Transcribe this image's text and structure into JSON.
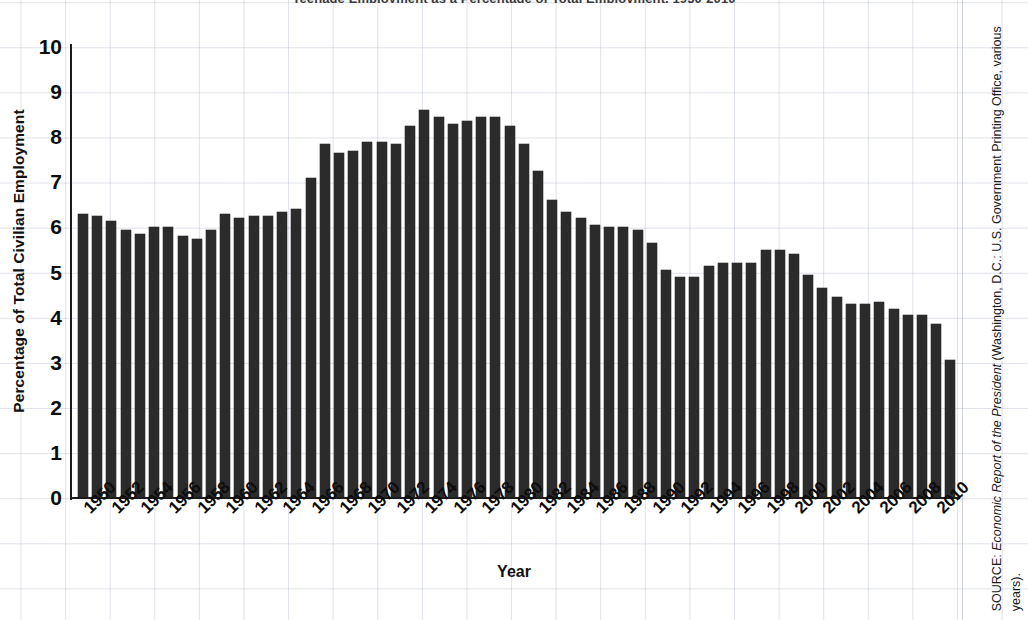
{
  "title": "Teenage Employment as a Percentage of Total Employment, 1950-2010",
  "axes": {
    "y_title": "Percentage of Total Civilian Employment",
    "x_title": "Year",
    "y_ticks": [
      "10",
      "9",
      "8",
      "7",
      "6",
      "5",
      "4",
      "3",
      "2",
      "1",
      "0"
    ]
  },
  "source": {
    "prefix": "SOURCE: ",
    "italic": "Economic Report of the President",
    "rest": " (Washington, D.C.: U.S. Government Printing Office, various years)."
  },
  "colors": {
    "bar": "#2b2b2b",
    "axis": "#1c1c1c",
    "grid": "#96a0b9",
    "background": "#ffffff"
  },
  "chart_data": {
    "type": "bar",
    "title": "Teenage Employment as a Percentage of Total Employment, 1950-2010",
    "xlabel": "Year",
    "ylabel": "Percentage of Total Civilian Employment",
    "ylim": [
      0,
      10
    ],
    "ytick_step": 1,
    "grid": true,
    "legend": "none",
    "xtick_step": 2,
    "categories": [
      1950,
      1951,
      1952,
      1953,
      1954,
      1955,
      1956,
      1957,
      1958,
      1959,
      1960,
      1961,
      1962,
      1963,
      1964,
      1965,
      1966,
      1967,
      1968,
      1969,
      1970,
      1971,
      1972,
      1973,
      1974,
      1975,
      1976,
      1977,
      1978,
      1979,
      1980,
      1981,
      1982,
      1983,
      1984,
      1985,
      1986,
      1987,
      1988,
      1989,
      1990,
      1991,
      1992,
      1993,
      1994,
      1995,
      1996,
      1997,
      1998,
      1999,
      2000,
      2001,
      2002,
      2003,
      2004,
      2005,
      2006,
      2007,
      2008,
      2009,
      2010
    ],
    "values": [
      6.3,
      6.25,
      6.15,
      5.95,
      5.85,
      6.0,
      6.0,
      5.8,
      5.75,
      5.95,
      6.3,
      6.2,
      6.25,
      6.25,
      6.35,
      6.4,
      7.1,
      7.85,
      7.65,
      7.7,
      7.9,
      7.9,
      7.85,
      8.25,
      8.6,
      8.45,
      8.3,
      8.35,
      8.45,
      8.45,
      8.25,
      7.85,
      7.25,
      6.6,
      6.35,
      6.2,
      6.05,
      6.0,
      6.0,
      5.95,
      5.65,
      5.05,
      4.9,
      4.9,
      5.15,
      5.2,
      5.2,
      5.2,
      5.5,
      5.5,
      5.4,
      4.95,
      4.65,
      4.45,
      4.3,
      4.3,
      4.35,
      4.2,
      4.05,
      4.05,
      3.85
    ],
    "note": "Last plotted bar (partial-year 2010 follow-on) reaches 3.05"
  },
  "extra_bar": {
    "value": 3.05
  }
}
